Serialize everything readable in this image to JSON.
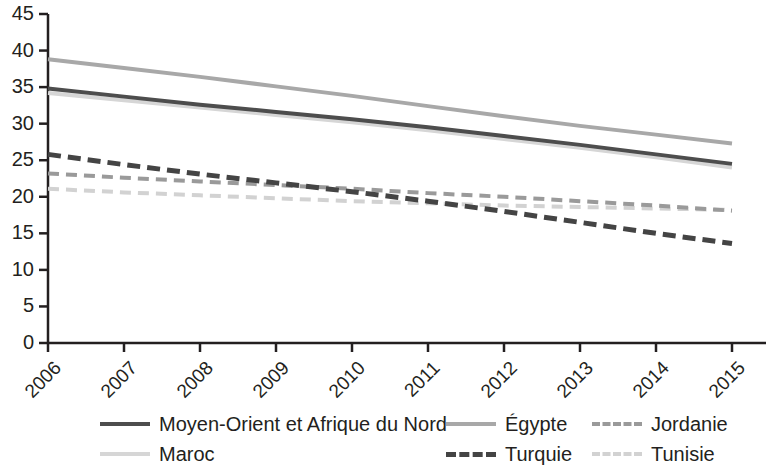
{
  "chart_data": {
    "type": "line",
    "title": "",
    "xlabel": "",
    "ylabel": "",
    "x": [
      2006,
      2007,
      2008,
      2009,
      2010,
      2011,
      2012,
      2013,
      2014,
      2015
    ],
    "xtick_labels": [
      "2006",
      "2007",
      "2008",
      "2009",
      "2010",
      "2011",
      "2012",
      "2013",
      "2014",
      "2015"
    ],
    "ytick_labels": [
      "0",
      "5",
      "10",
      "15",
      "20",
      "25",
      "30",
      "35",
      "40",
      "45"
    ],
    "ytick_values": [
      0,
      5,
      10,
      15,
      20,
      25,
      30,
      35,
      40,
      45
    ],
    "ylim": [
      0,
      45
    ],
    "xlim": [
      2006,
      2015
    ],
    "grid": false,
    "legend_position": "bottom",
    "series": [
      {
        "name": "Moyen-Orient et Afrique du Nord",
        "style": "solid",
        "color": "#4d4d4d",
        "width": 4,
        "values": [
          34.8,
          33.7,
          32.6,
          31.6,
          30.6,
          29.5,
          28.3,
          27.1,
          25.8,
          24.5
        ]
      },
      {
        "name": "Maroc",
        "style": "solid",
        "color": "#d6d6d6",
        "width": 4,
        "values": [
          34.2,
          33.2,
          32.2,
          31.2,
          30.2,
          29.1,
          27.9,
          26.7,
          25.4,
          24.0
        ]
      },
      {
        "name": "Égypte",
        "style": "solid",
        "color": "#a8a8a8",
        "width": 4,
        "values": [
          38.8,
          37.6,
          36.4,
          35.1,
          33.8,
          32.4,
          31.0,
          29.7,
          28.5,
          27.3
        ]
      },
      {
        "name": "Jordanie",
        "style": "dashed",
        "color": "#9a9a9a",
        "width": 4,
        "values": [
          23.2,
          22.6,
          22.1,
          21.6,
          21.1,
          20.5,
          20.0,
          19.4,
          18.8,
          18.1
        ]
      },
      {
        "name": "Turquie",
        "style": "dashed",
        "color": "#444444",
        "width": 5,
        "values": [
          25.8,
          24.4,
          23.1,
          21.9,
          20.7,
          19.4,
          18.0,
          16.5,
          15.0,
          13.6
        ]
      },
      {
        "name": "Tunisie",
        "style": "dashed",
        "color": "#d2d2d2",
        "width": 4,
        "values": [
          21.1,
          20.6,
          20.2,
          19.8,
          19.4,
          19.1,
          18.8,
          18.6,
          18.4,
          18.2
        ]
      }
    ]
  },
  "legend": {
    "entries": [
      {
        "label": "Moyen-Orient et Afrique du Nord",
        "col": 0,
        "row": 0
      },
      {
        "label": "Maroc",
        "col": 0,
        "row": 1
      },
      {
        "label": "Égypte",
        "col": 1,
        "row": 0
      },
      {
        "label": "Turquie",
        "col": 1,
        "row": 1
      },
      {
        "label": "Jordanie",
        "col": 2,
        "row": 0
      },
      {
        "label": "Tunisie",
        "col": 2,
        "row": 1
      }
    ]
  },
  "axis": {
    "color": "#231f20"
  }
}
